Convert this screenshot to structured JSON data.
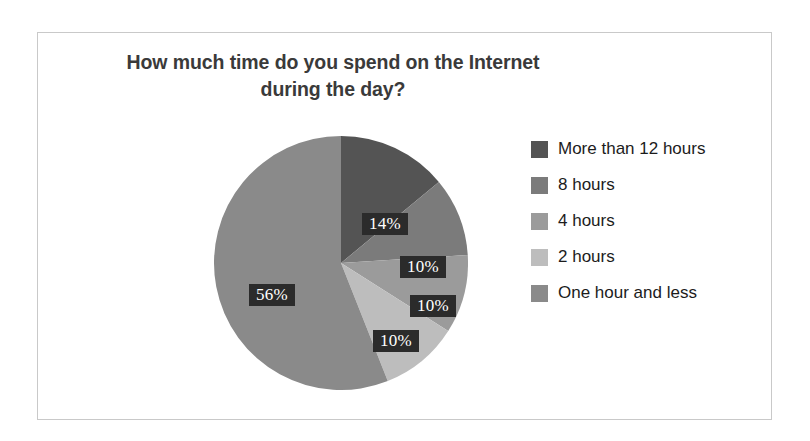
{
  "chart_data": {
    "type": "pie",
    "title": "How much time do you spend on the Internet during the day?",
    "title_lines": [
      "How much time do you spend on the Internet",
      "during the day?"
    ],
    "categories": [
      "More than 12 hours",
      "8 hours",
      "4 hours",
      "2 hours",
      "One hour and less"
    ],
    "values": [
      14,
      10,
      10,
      10,
      56
    ],
    "value_labels": [
      "14%",
      "10%",
      "10%",
      "10%",
      "56%"
    ],
    "colors": [
      "#545454",
      "#7b7b7b",
      "#9b9b9b",
      "#bdbdbd",
      "#8a8a8a"
    ],
    "unit": "%",
    "legend_position": "right",
    "start_angle": 0,
    "direction": "clockwise",
    "grid": false,
    "xlabel": "",
    "ylabel": ""
  },
  "legend": {
    "items": [
      {
        "label": "More than 12 hours",
        "color": "#545454"
      },
      {
        "label": "8 hours",
        "color": "#7b7b7b"
      },
      {
        "label": "4 hours",
        "color": "#9b9b9b"
      },
      {
        "label": "2 hours",
        "color": "#bdbdbd"
      },
      {
        "label": "One hour and less",
        "color": "#8a8a8a"
      }
    ]
  },
  "slice_labels": [
    {
      "text": "14%",
      "left": 148,
      "top": 77
    },
    {
      "text": "10%",
      "left": 186,
      "top": 120
    },
    {
      "text": "10%",
      "left": 196,
      "top": 159
    },
    {
      "text": "10%",
      "left": 159,
      "top": 194
    },
    {
      "text": "56%",
      "left": 35,
      "top": 148
    }
  ]
}
